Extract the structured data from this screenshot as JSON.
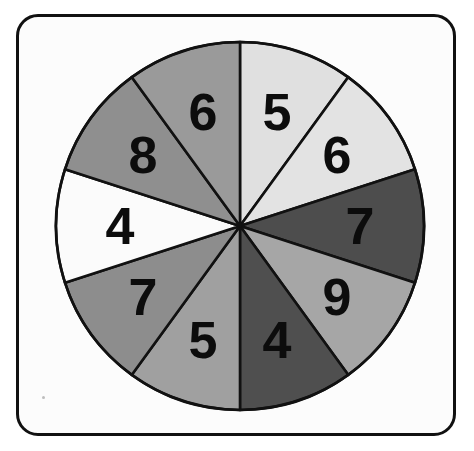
{
  "figure": {
    "kind": "spinner-wheel",
    "frame": {
      "border_color": "#111111",
      "background_color": "#fcfcfc",
      "corner_radius": "22px"
    },
    "wheel": {
      "center_x": 240,
      "center_y": 226,
      "radius": 184,
      "outline_color": "#111111",
      "outline_width": 2.6,
      "sector_count": 10,
      "sector_angle_degrees": 36,
      "start_angle_degrees": 0,
      "label_color": "#0c0c0c",
      "label_radius": 120
    },
    "palette": {
      "white": "#fbfbfb",
      "very_light_gray": "#e3e3e3",
      "light_gray": "#dcdcdc",
      "medium_gray": "#a6a6a6",
      "medium_dark_gray": "#8f8f8f",
      "dark_gray": "#6e6e6e",
      "darkest_gray": "#4a4a4a"
    }
  },
  "chart_data": {
    "type": "pie",
    "title": "",
    "subtitle": "",
    "xlabel": "",
    "ylabel": "",
    "legend_position": "none",
    "grid": false,
    "equal_sectors": true,
    "total_sectors": 10,
    "sector_share_percent": 10,
    "categories": [
      "5",
      "6",
      "7",
      "9",
      "4",
      "5",
      "7",
      "4",
      "8",
      "6"
    ],
    "values": [
      10,
      10,
      10,
      10,
      10,
      10,
      10,
      10,
      10,
      10
    ],
    "labels": [
      "5",
      "6",
      "7",
      "9",
      "4",
      "5",
      "7",
      "4",
      "8",
      "6"
    ],
    "sectors": [
      {
        "index": 0,
        "label": "5",
        "start_deg": 0,
        "end_deg": 36,
        "fill": "#e0e0e0",
        "position": "top-right"
      },
      {
        "index": 1,
        "label": "6",
        "start_deg": 36,
        "end_deg": 72,
        "fill": "#e3e3e3",
        "position": "right-upper"
      },
      {
        "index": 2,
        "label": "7",
        "start_deg": 72,
        "end_deg": 108,
        "fill": "#4d4d4d",
        "position": "right"
      },
      {
        "index": 3,
        "label": "9",
        "start_deg": 108,
        "end_deg": 144,
        "fill": "#a6a6a6",
        "position": "right-lower"
      },
      {
        "index": 4,
        "label": "4",
        "start_deg": 144,
        "end_deg": 180,
        "fill": "#4f4f4f",
        "position": "bottom-right"
      },
      {
        "index": 5,
        "label": "5",
        "start_deg": 180,
        "end_deg": 216,
        "fill": "#a0a0a0",
        "position": "bottom-left"
      },
      {
        "index": 6,
        "label": "7",
        "start_deg": 216,
        "end_deg": 252,
        "fill": "#8d8d8d",
        "position": "left-lower"
      },
      {
        "index": 7,
        "label": "4",
        "start_deg": 252,
        "end_deg": 288,
        "fill": "#fbfbfb",
        "position": "left"
      },
      {
        "index": 8,
        "label": "8",
        "start_deg": 288,
        "end_deg": 324,
        "fill": "#8f8f8f",
        "position": "left-upper"
      },
      {
        "index": 9,
        "label": "6",
        "start_deg": 324,
        "end_deg": 360,
        "fill": "#9a9a9a",
        "position": "top-left"
      }
    ]
  }
}
